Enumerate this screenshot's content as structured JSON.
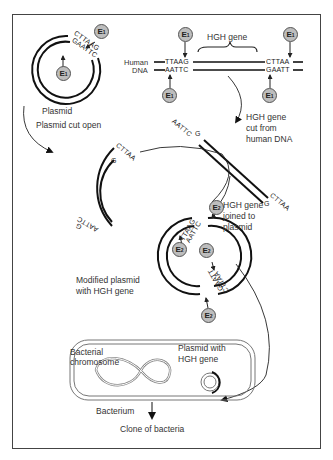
{
  "enzymes": {
    "e1": "E",
    "e1_sub": "1",
    "e2": "E",
    "e2_sub": "2"
  },
  "labels": {
    "plasmid": "Plasmid",
    "plasmid_cut_open": "Plasmid cut open",
    "human_dna_line1": "Human",
    "human_dna_line2": "DNA",
    "hgh_gene": "HGH gene",
    "hgh_cut_line1": "HGH gene",
    "hgh_cut_line2": "cut from",
    "hgh_cut_line3": "human DNA",
    "hgh_joined_line1": "HGH gene",
    "hgh_joined_line2": "joined to",
    "hgh_joined_line3": "plasmid",
    "modified_line1": "Modified plasmid",
    "modified_line2": "with HGH gene",
    "bact_chrom_line1": "Bacterial",
    "bact_chrom_line2": "chromosome",
    "plasmid_hgh_line1": "Plasmid with",
    "plasmid_hgh_line2": "HGH gene",
    "bacterium": "Bacterium",
    "clone": "Clone of bacteria"
  },
  "sequences": {
    "plasmid_top": "CTTAAG",
    "plasmid_bottom": "GAATTC",
    "human_left_top": "TTAAG",
    "human_left_bottom": "AATTC",
    "human_right_top": "CTTAA",
    "human_right_bottom": "GAATT",
    "open_top_a": "CTTAA",
    "open_top_b": "G",
    "open_bottom_a": "AATTC",
    "open_bottom_b": "G",
    "frag_left_a": "AATTC",
    "frag_left_b": "G",
    "frag_right_a": "CTTAA",
    "frag_right_b": "G",
    "mod_top_a": "TTAAG",
    "mod_top_b": "AATTC",
    "mod_bottom_a": "CTTAA",
    "mod_bottom_b": "GAATT"
  }
}
